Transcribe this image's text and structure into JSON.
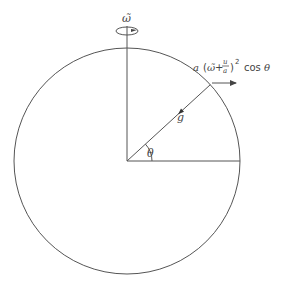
{
  "diagram": {
    "axis_label": "ω̃",
    "vector_label": "g",
    "angle_label": "θ",
    "formula": {
      "prefix": "a",
      "open": "(",
      "omega": "ω̃",
      "plus": "+",
      "numerator": "u",
      "denominator": "a",
      "close": ")",
      "exponent": "2",
      "cos": "cos",
      "theta": "θ"
    },
    "angle_degrees": 42.5,
    "stroke_color": "#555555"
  }
}
